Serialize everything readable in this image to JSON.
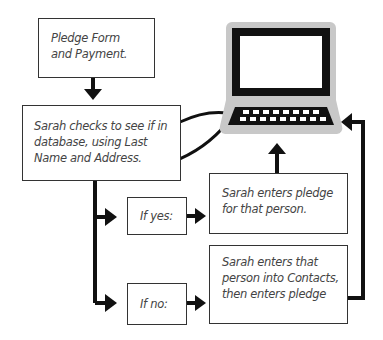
{
  "diagram": {
    "type": "flowchart",
    "nodes": {
      "pledge_form": {
        "text": "Pledge Form and Payment."
      },
      "check_database": {
        "text": "Sarah checks to see if in database, using Last Name and Address."
      },
      "if_yes": {
        "text": "If yes:"
      },
      "if_no": {
        "text": "If no:"
      },
      "enter_pledge": {
        "text": "Sarah enters pledge for that person."
      },
      "enter_contact": {
        "text": "Sarah enters that person into Contacts, then enters pledge"
      },
      "computer": {
        "icon": "computer-icon"
      }
    },
    "edges": [
      {
        "from": "pledge_form",
        "to": "check_database"
      },
      {
        "from": "computer",
        "to": "check_database"
      },
      {
        "from": "check_database",
        "to": "if_yes"
      },
      {
        "from": "check_database",
        "to": "if_no"
      },
      {
        "from": "if_yes",
        "to": "enter_pledge"
      },
      {
        "from": "if_no",
        "to": "enter_contact"
      },
      {
        "from": "enter_pledge",
        "to": "computer"
      },
      {
        "from": "enter_contact",
        "to": "computer"
      }
    ],
    "colors": {
      "line": "#111111",
      "box_border": "#333333",
      "text": "#444444",
      "monitor_halo": "#c8c8c8"
    }
  }
}
